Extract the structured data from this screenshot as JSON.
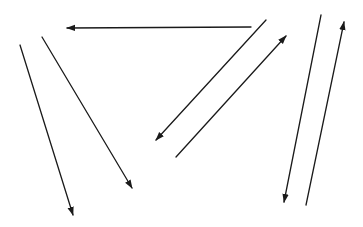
{
  "diagram": {
    "background": "#ffffff",
    "stroke_color": "#1a1a1a",
    "stroke_width": 1.3,
    "arrows": [
      {
        "id": "arrow-1",
        "from": [
          20,
          45
        ],
        "to": [
          73,
          215
        ]
      },
      {
        "id": "arrow-2",
        "from": [
          42,
          37
        ],
        "to": [
          132,
          188
        ]
      },
      {
        "id": "arrow-3",
        "from": [
          251,
          27
        ],
        "to": [
          67,
          28
        ]
      },
      {
        "id": "arrow-4",
        "from": [
          266,
          20
        ],
        "to": [
          156,
          140
        ]
      },
      {
        "id": "arrow-5",
        "from": [
          176,
          157
        ],
        "to": [
          286,
          36
        ]
      },
      {
        "id": "arrow-6",
        "from": [
          321,
          15
        ],
        "to": [
          284,
          202
        ]
      },
      {
        "id": "arrow-7",
        "from": [
          306,
          205
        ],
        "to": [
          344,
          22
        ]
      }
    ]
  }
}
